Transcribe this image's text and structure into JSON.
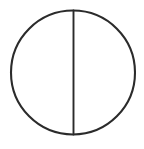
{
  "figure": {
    "kind": "line-drawing",
    "canvas": {
      "width": 144,
      "height": 149,
      "background_color": "#ffffff"
    },
    "ink_color": "#2b2b2b",
    "shapes": [
      {
        "name": "circle-outline",
        "type": "circle",
        "center_x": 73,
        "center_y": 72.5,
        "radius": 62,
        "stroke_width": 2.1,
        "stroke_color": "#2b2b2b",
        "fill": "none"
      },
      {
        "name": "vertical-diameter",
        "type": "line",
        "x1": 73.5,
        "y1": 10.5,
        "x2": 73.5,
        "y2": 134.5,
        "stroke_width": 1.9,
        "stroke_color": "#2b2b2b"
      }
    ],
    "labels": [],
    "annotations": []
  }
}
